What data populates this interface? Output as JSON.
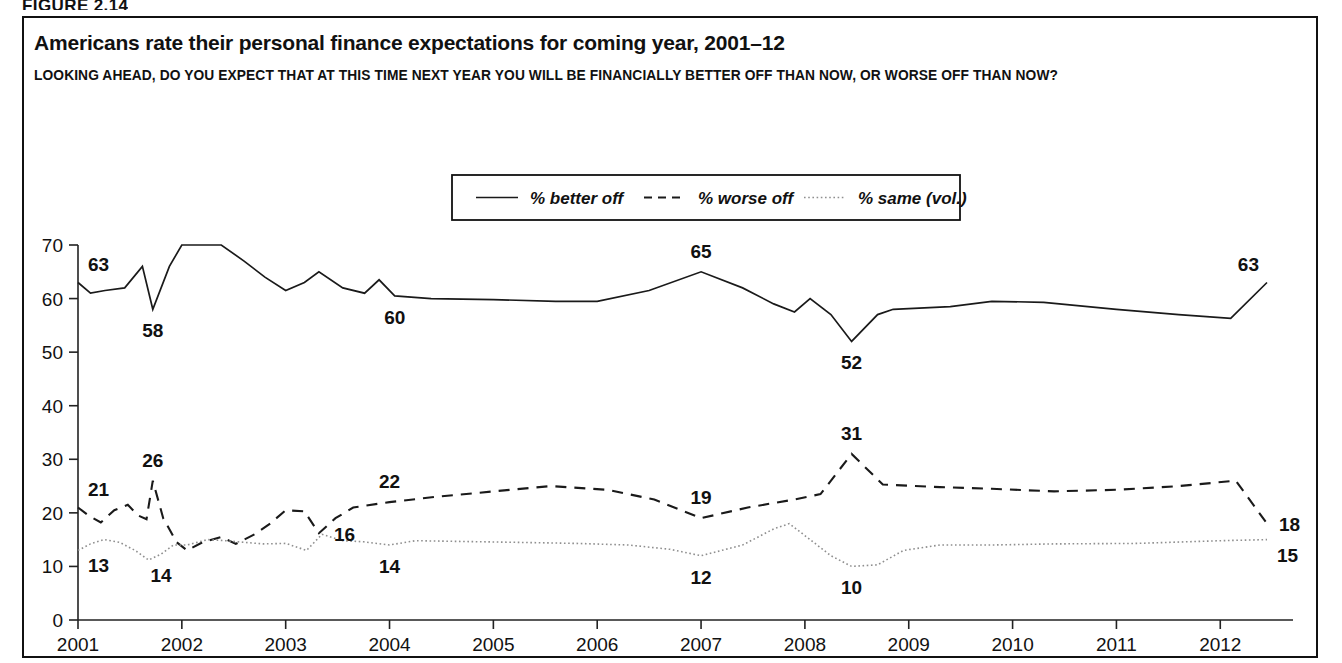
{
  "figure": {
    "label": "FIGURE 2.14"
  },
  "chart": {
    "title": "Americans rate their personal finance expectations for coming year, 2001–12",
    "subtitle": "LOOKING AHEAD, DO YOU EXPECT THAT AT THIS TIME NEXT YEAR YOU WILL BE FINANCIALLY BETTER OFF THAN NOW, OR WORSE OFF THAN NOW?",
    "legend": [
      {
        "label": "% better off",
        "style": "solid",
        "color": "#1a1a1a"
      },
      {
        "label": "% worse off",
        "style": "dashed",
        "color": "#1a1a1a"
      },
      {
        "label": "% same (vol.)",
        "style": "dotted",
        "color": "#8f8f8f"
      }
    ]
  },
  "chart_data": {
    "type": "line",
    "title": "Americans rate their personal finance expectations for coming year, 2001–12",
    "subtitle": "LOOKING AHEAD, DO YOU EXPECT THAT AT THIS TIME NEXT YEAR YOU WILL BE FINANCIALLY BETTER OFF THAN NOW, OR WORSE OFF THAN NOW?",
    "xlabel": "",
    "ylabel": "",
    "xlim": [
      2001.0,
      2012.45
    ],
    "ylim": [
      0,
      70
    ],
    "yticks": [
      0,
      10,
      20,
      30,
      40,
      50,
      60,
      70
    ],
    "xticks": [
      2001,
      2002,
      2003,
      2004,
      2005,
      2006,
      2007,
      2008,
      2009,
      2010,
      2011,
      2012
    ],
    "xtick_labels": [
      "2001",
      "2002",
      "2003",
      "2004",
      "2005",
      "2006",
      "2007",
      "2008",
      "2009",
      "2010",
      "2011",
      "2012"
    ],
    "grid": false,
    "legend_position": "top-center",
    "series": [
      {
        "name": "% better off",
        "style": "solid",
        "color": "#1a1a1a",
        "points": [
          [
            2001.0,
            63
          ],
          [
            2001.12,
            61
          ],
          [
            2001.26,
            61.5
          ],
          [
            2001.45,
            62
          ],
          [
            2001.62,
            66
          ],
          [
            2001.72,
            58
          ],
          [
            2001.88,
            66
          ],
          [
            2002.0,
            70
          ],
          [
            2002.22,
            70
          ],
          [
            2002.38,
            70
          ],
          [
            2002.6,
            67
          ],
          [
            2002.8,
            64
          ],
          [
            2003.0,
            61.5
          ],
          [
            2003.18,
            63
          ],
          [
            2003.32,
            65
          ],
          [
            2003.55,
            62
          ],
          [
            2003.76,
            61
          ],
          [
            2003.9,
            63.5
          ],
          [
            2004.05,
            60.5
          ],
          [
            2004.4,
            60
          ],
          [
            2005.0,
            59.8
          ],
          [
            2005.6,
            59.5
          ],
          [
            2006.0,
            59.5
          ],
          [
            2006.5,
            61.5
          ],
          [
            2007.0,
            65
          ],
          [
            2007.4,
            62
          ],
          [
            2007.7,
            59
          ],
          [
            2007.9,
            57.5
          ],
          [
            2008.05,
            60
          ],
          [
            2008.25,
            57
          ],
          [
            2008.45,
            52
          ],
          [
            2008.7,
            57
          ],
          [
            2008.85,
            58
          ],
          [
            2009.4,
            58.5
          ],
          [
            2009.8,
            59.5
          ],
          [
            2010.3,
            59.3
          ],
          [
            2011.0,
            58
          ],
          [
            2011.6,
            57
          ],
          [
            2012.1,
            56.3
          ],
          [
            2012.45,
            63
          ]
        ],
        "labels": [
          {
            "x": 2001.0,
            "y": 63,
            "text": "63",
            "pos": "above-right"
          },
          {
            "x": 2001.72,
            "y": 58,
            "text": "58",
            "pos": "below"
          },
          {
            "x": 2004.05,
            "y": 60.5,
            "text": "60",
            "pos": "below"
          },
          {
            "x": 2007.0,
            "y": 65,
            "text": "65",
            "pos": "above"
          },
          {
            "x": 2008.45,
            "y": 52,
            "text": "52",
            "pos": "below"
          },
          {
            "x": 2012.45,
            "y": 63,
            "text": "63",
            "pos": "above-left"
          }
        ]
      },
      {
        "name": "% worse off",
        "style": "dashed",
        "color": "#1a1a1a",
        "points": [
          [
            2001.0,
            21
          ],
          [
            2001.1,
            19.5
          ],
          [
            2001.22,
            18.2
          ],
          [
            2001.35,
            20.5
          ],
          [
            2001.48,
            21.5
          ],
          [
            2001.58,
            19.5
          ],
          [
            2001.66,
            18.8
          ],
          [
            2001.72,
            26
          ],
          [
            2001.82,
            19
          ],
          [
            2001.95,
            14.5
          ],
          [
            2002.05,
            13
          ],
          [
            2002.2,
            14.5
          ],
          [
            2002.38,
            15.5
          ],
          [
            2002.52,
            14.2
          ],
          [
            2002.7,
            16
          ],
          [
            2002.85,
            18
          ],
          [
            2003.0,
            20.5
          ],
          [
            2003.18,
            20.3
          ],
          [
            2003.32,
            16.2
          ],
          [
            2003.48,
            19
          ],
          [
            2003.65,
            21
          ],
          [
            2004.0,
            22
          ],
          [
            2004.45,
            23
          ],
          [
            2005.0,
            24
          ],
          [
            2005.55,
            25
          ],
          [
            2006.1,
            24.3
          ],
          [
            2006.55,
            22.5
          ],
          [
            2007.0,
            19
          ],
          [
            2007.45,
            21
          ],
          [
            2007.9,
            22.5
          ],
          [
            2008.15,
            23.5
          ],
          [
            2008.45,
            31
          ],
          [
            2008.75,
            25.3
          ],
          [
            2009.3,
            24.8
          ],
          [
            2009.8,
            24.5
          ],
          [
            2010.4,
            24
          ],
          [
            2011.0,
            24.3
          ],
          [
            2011.6,
            25
          ],
          [
            2012.15,
            26
          ],
          [
            2012.45,
            18
          ]
        ],
        "labels": [
          {
            "x": 2001.0,
            "y": 21,
            "text": "21",
            "pos": "above-right"
          },
          {
            "x": 2001.72,
            "y": 26,
            "text": "26",
            "pos": "above"
          },
          {
            "x": 2004.0,
            "y": 22,
            "text": "22",
            "pos": "above"
          },
          {
            "x": 2007.0,
            "y": 19,
            "text": "19",
            "pos": "above"
          },
          {
            "x": 2008.45,
            "y": 31,
            "text": "31",
            "pos": "above"
          },
          {
            "x": 2012.45,
            "y": 18,
            "text": "18",
            "pos": "right"
          }
        ]
      },
      {
        "name": "% same (vol.)",
        "style": "dotted",
        "color": "#8f8f8f",
        "points": [
          [
            2001.0,
            13
          ],
          [
            2001.12,
            14.2
          ],
          [
            2001.25,
            15
          ],
          [
            2001.4,
            14.5
          ],
          [
            2001.55,
            13
          ],
          [
            2001.68,
            11.2
          ],
          [
            2001.8,
            12.3
          ],
          [
            2001.92,
            14
          ],
          [
            2002.05,
            14
          ],
          [
            2002.25,
            15
          ],
          [
            2002.42,
            14.8
          ],
          [
            2002.6,
            14.5
          ],
          [
            2002.78,
            14.2
          ],
          [
            2003.0,
            14.3
          ],
          [
            2003.2,
            13
          ],
          [
            2003.35,
            16
          ],
          [
            2003.55,
            14.8
          ],
          [
            2003.75,
            14.6
          ],
          [
            2004.0,
            14
          ],
          [
            2004.25,
            14.8
          ],
          [
            2004.6,
            14.7
          ],
          [
            2005.2,
            14.5
          ],
          [
            2005.8,
            14.3
          ],
          [
            2006.3,
            14
          ],
          [
            2006.7,
            13.2
          ],
          [
            2007.0,
            12
          ],
          [
            2007.4,
            14
          ],
          [
            2007.7,
            17
          ],
          [
            2007.85,
            18
          ],
          [
            2008.05,
            15
          ],
          [
            2008.25,
            12
          ],
          [
            2008.45,
            10
          ],
          [
            2008.7,
            10.3
          ],
          [
            2008.95,
            13
          ],
          [
            2009.3,
            14
          ],
          [
            2009.8,
            14
          ],
          [
            2010.4,
            14.2
          ],
          [
            2011.2,
            14.3
          ],
          [
            2012.0,
            14.8
          ],
          [
            2012.45,
            15
          ]
        ],
        "labels": [
          {
            "x": 2001.0,
            "y": 13,
            "text": "13",
            "pos": "below-right"
          },
          {
            "x": 2001.8,
            "y": 12.3,
            "text": "14",
            "pos": "below"
          },
          {
            "x": 2003.35,
            "y": 16,
            "text": "16",
            "pos": "right"
          },
          {
            "x": 2004.0,
            "y": 14,
            "text": "14",
            "pos": "below"
          },
          {
            "x": 2007.0,
            "y": 12,
            "text": "12",
            "pos": "below"
          },
          {
            "x": 2008.45,
            "y": 10,
            "text": "10",
            "pos": "below"
          },
          {
            "x": 2012.45,
            "y": 15,
            "text": "15",
            "pos": "below-right"
          }
        ]
      }
    ]
  }
}
